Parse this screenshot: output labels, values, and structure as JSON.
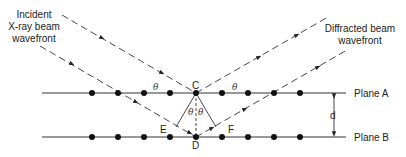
{
  "labels": {
    "incident_line1": "Incident",
    "incident_line2": "X-ray beam",
    "incident_line3": "wavefront",
    "diffracted_line1": "Diffracted beam",
    "diffracted_line2": "wavefront",
    "plane_a": "Plane A",
    "plane_b": "Plane B",
    "spacing": "d",
    "point_c": "C",
    "point_d": "D",
    "point_e": "E",
    "point_f": "F",
    "angle": "θ"
  },
  "atoms_per_plane": 9
}
